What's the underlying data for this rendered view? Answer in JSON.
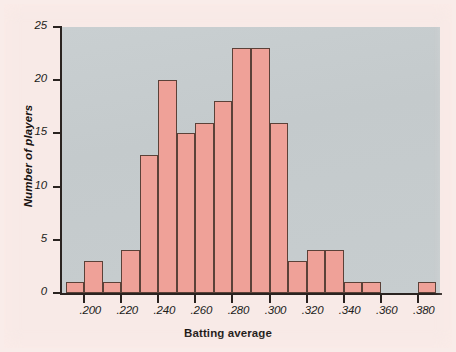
{
  "chart_data": {
    "type": "bar",
    "title": "",
    "subtitle": "",
    "xlabel": "Batting average",
    "ylabel": "Number of players",
    "bin_width": 0.01,
    "bin_starts": [
      0.19,
      0.2,
      0.21,
      0.22,
      0.23,
      0.24,
      0.25,
      0.26,
      0.27,
      0.28,
      0.29,
      0.3,
      0.31,
      0.32,
      0.33,
      0.34,
      0.35,
      0.36,
      0.37,
      0.38
    ],
    "categories": [
      ".190-.200",
      ".200-.210",
      ".210-.220",
      ".220-.230",
      ".230-.240",
      ".240-.250",
      ".250-.260",
      ".260-.270",
      ".270-.280",
      ".280-.290",
      ".290-.300",
      ".300-.310",
      ".310-.320",
      ".320-.330",
      ".330-.340",
      ".340-.350",
      ".350-.360",
      ".360-.370",
      ".370-.380",
      ".380-.390"
    ],
    "values": [
      1,
      3,
      1,
      4,
      13,
      20,
      15,
      16,
      18,
      23,
      23,
      16,
      3,
      4,
      4,
      1,
      1,
      0,
      0,
      1
    ],
    "xlim": [
      0.188,
      0.392
    ],
    "ylim": [
      0,
      25
    ],
    "xticks": [
      0.2,
      0.22,
      0.24,
      0.26,
      0.28,
      0.3,
      0.32,
      0.34,
      0.36,
      0.38
    ],
    "xtick_labels": [
      ".200",
      ".220",
      ".240",
      ".260",
      ".280",
      ".300",
      ".320",
      ".340",
      ".360",
      ".380"
    ],
    "yticks": [
      0,
      5,
      10,
      15,
      20,
      25
    ],
    "ytick_labels": [
      "0",
      "5",
      "10",
      "15",
      "20",
      "25"
    ],
    "grid": false,
    "legend": null,
    "bar_color": "#efa198",
    "bar_edge_color": "#5b4138",
    "plot_background": "#c7cdcf",
    "figure_background": "#f8eae7"
  }
}
